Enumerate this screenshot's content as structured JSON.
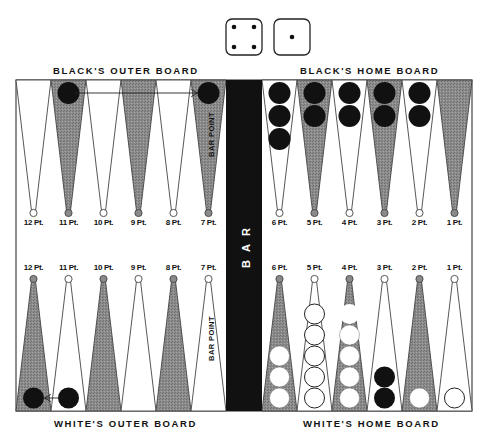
{
  "dice": [
    {
      "value": 4,
      "pips": [
        [
          -1,
          -1
        ],
        [
          1,
          -1
        ],
        [
          -1,
          1
        ],
        [
          1,
          1
        ]
      ]
    },
    {
      "value": 1,
      "pips": [
        [
          0,
          0
        ]
      ]
    }
  ],
  "labels": {
    "black_outer": "BLACK'S OUTER BOARD",
    "black_home": "BLACK'S HOME BOARD",
    "white_outer": "WHITE'S OUTER BOARD",
    "white_home": "WHITE'S HOME BOARD",
    "bar": "BAR",
    "bar_point": "BAR POINT"
  },
  "colors": {
    "shaded_point": "#8a8a8a",
    "light_point": "#ffffff",
    "black_checker": "#111111",
    "white_checker": "#ffffff",
    "bar": "#111111",
    "outline": "#333333"
  },
  "top_points": [
    {
      "label": "12 Pt.",
      "shade": "light",
      "black": 0
    },
    {
      "label": "11 Pt.",
      "shade": "dark",
      "black": 1
    },
    {
      "label": "10 Pt.",
      "shade": "light",
      "black": 0
    },
    {
      "label": "9 Pt.",
      "shade": "dark",
      "black": 0
    },
    {
      "label": "8 Pt.",
      "shade": "light",
      "black": 0
    },
    {
      "label": "7 Pt.",
      "shade": "dark",
      "black": 1
    },
    {
      "label": "6 Pt.",
      "shade": "light",
      "black": 3
    },
    {
      "label": "5 Pt.",
      "shade": "dark",
      "black": 2
    },
    {
      "label": "4 Pt.",
      "shade": "light",
      "black": 2
    },
    {
      "label": "3 Pt.",
      "shade": "dark",
      "black": 2
    },
    {
      "label": "2 Pt.",
      "shade": "light",
      "black": 2
    },
    {
      "label": "1 Pt.",
      "shade": "dark",
      "black": 0
    }
  ],
  "bottom_points": [
    {
      "label": "12 Pt.",
      "shade": "dark",
      "white": 0,
      "black": 1
    },
    {
      "label": "11 Pt.",
      "shade": "light",
      "white": 0,
      "black": 1
    },
    {
      "label": "10 Pt.",
      "shade": "dark",
      "white": 0,
      "black": 0
    },
    {
      "label": "9 Pt.",
      "shade": "light",
      "white": 0,
      "black": 0
    },
    {
      "label": "8 Pt.",
      "shade": "dark",
      "white": 0,
      "black": 0
    },
    {
      "label": "7 Pt.",
      "shade": "light",
      "white": 0,
      "black": 0
    },
    {
      "label": "6 Pt.",
      "shade": "dark",
      "white": 3,
      "black": 0
    },
    {
      "label": "5 Pt.",
      "shade": "light",
      "white": 5,
      "black": 0,
      "outlined": true
    },
    {
      "label": "4 Pt.",
      "shade": "dark",
      "white": 4,
      "black": 0,
      "ghost": 1
    },
    {
      "label": "3 Pt.",
      "shade": "light",
      "white": 0,
      "black": 2
    },
    {
      "label": "2 Pt.",
      "shade": "dark",
      "white": 1,
      "black": 0
    },
    {
      "label": "1 Pt.",
      "shade": "light",
      "white": 1,
      "black": 0,
      "outlined": true
    }
  ],
  "moves": [
    {
      "description": "Black checker moves from 11 Pt. to 7 Pt. (bar point)",
      "side": "top",
      "from": 1,
      "to": 5
    },
    {
      "description": "Black checker moves from 11 Pt. to 12 Pt.",
      "side": "bottom",
      "from": 1,
      "to": 0
    }
  ]
}
